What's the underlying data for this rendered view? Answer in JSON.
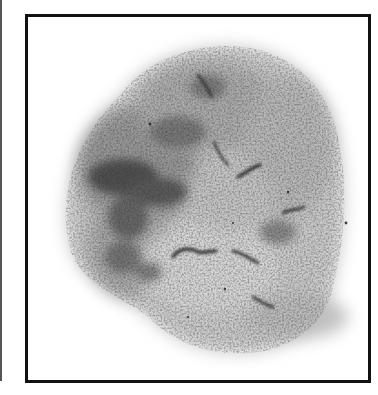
{
  "image": {
    "description": "Grayscale micrograph of a roughly rounded, mottled specimen inside a black rectangular frame",
    "caption": "",
    "colors": {
      "frame": "#111111",
      "edge_line": "#555555",
      "background": "#ffffff",
      "specimen_light": "#c8c8c8",
      "specimen_mid": "#9a9a9a",
      "specimen_dark": "#3a3a3a"
    }
  }
}
